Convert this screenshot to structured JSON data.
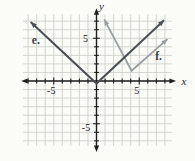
{
  "figure": {
    "description_labels": {
      "curve_e": "e.",
      "curve_f": "f."
    },
    "colors": {
      "background": "#fbfbf8",
      "axis": "#1f1f1f",
      "grid": "#c9cdc7",
      "tick_label": "#1a1a1a",
      "series_label": "#3d4145"
    }
  },
  "chart_data": {
    "type": "line",
    "title": "",
    "xlabel": "x",
    "ylabel": "y",
    "grid": true,
    "xlim": [
      -8.8,
      9.3
    ],
    "ylim": [
      -8.3,
      8.5
    ],
    "grid_rect": {
      "x": [
        -8.6,
        8.8
      ],
      "y": [
        -7.6,
        7.8
      ]
    },
    "x_ticks": {
      "from": -8,
      "to": 8,
      "labeled": [
        {
          "value": -5,
          "label": "-5",
          "dx": -2.5,
          "dy": 12.5
        },
        {
          "value": 5,
          "label": "5",
          "dx": -2.5,
          "dy": 12.5
        }
      ]
    },
    "y_ticks": {
      "from": -7,
      "to": 7,
      "labeled": [
        {
          "value": 5,
          "label": "5",
          "dx": -11,
          "dy": 3.5
        },
        {
          "value": -5,
          "label": "-5",
          "dx": -10.5,
          "dy": 7.5
        }
      ]
    },
    "series": [
      {
        "id": "f",
        "label": "f.",
        "color": "#9a9fa3",
        "stroke_width": 1.8,
        "points": [
          [
            0.9,
            7.2
          ],
          [
            4.1,
            1.2
          ],
          [
            8.3,
            4.9
          ]
        ],
        "arrows": [
          "start",
          "end"
        ],
        "label_anchor": [
          7.25,
          2.85
        ]
      },
      {
        "id": "e",
        "label": "e.",
        "color": "#4b5055",
        "stroke_width": 2,
        "points": [
          [
            -7.7,
            6.9
          ],
          [
            0,
            -0.3
          ],
          [
            7.9,
            7.1
          ]
        ],
        "arrows": [
          "start",
          "end"
        ],
        "label_anchor": [
          -7.1,
          4.8
        ]
      }
    ]
  }
}
